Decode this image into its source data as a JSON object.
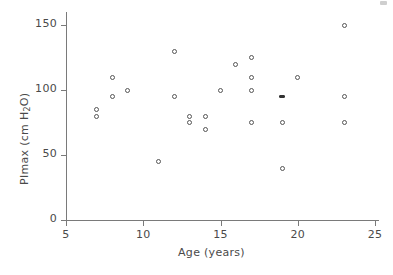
{
  "chart_data": {
    "type": "scatter",
    "title": "",
    "xlabel": "Age (years)",
    "ylabel_plain": "PImax (cm H2O)",
    "ylabel_pre": "PImax (cm H",
    "ylabel_sub": "2",
    "ylabel_post": "O)",
    "xlim": [
      5,
      25
    ],
    "ylim": [
      0,
      160
    ],
    "xticks": [
      5,
      10,
      15,
      20,
      25
    ],
    "xtick_labels": [
      "5",
      "10",
      "15",
      "20",
      "25"
    ],
    "yticks": [
      0,
      50,
      100,
      150
    ],
    "ytick_labels": [
      "0",
      "50",
      "100",
      "150"
    ],
    "grid": false,
    "legend": null,
    "marker": "open-circle",
    "x": [
      7,
      7,
      8,
      8,
      9,
      11,
      12,
      12,
      13,
      13,
      14,
      14,
      15,
      16,
      17,
      17,
      17,
      17,
      19,
      19,
      19,
      20,
      23,
      23,
      23
    ],
    "y": [
      80,
      85,
      110,
      95,
      100,
      45,
      130,
      95,
      75,
      80,
      70,
      80,
      100,
      120,
      125,
      110,
      100,
      75,
      40,
      75,
      95,
      110,
      150,
      95,
      75
    ],
    "points": [
      {
        "x": 7,
        "y": 80,
        "style": "open"
      },
      {
        "x": 7,
        "y": 85,
        "style": "open"
      },
      {
        "x": 8,
        "y": 110,
        "style": "open"
      },
      {
        "x": 8,
        "y": 95,
        "style": "open"
      },
      {
        "x": 9,
        "y": 100,
        "style": "open"
      },
      {
        "x": 11,
        "y": 45,
        "style": "open"
      },
      {
        "x": 12,
        "y": 130,
        "style": "open"
      },
      {
        "x": 12,
        "y": 95,
        "style": "open"
      },
      {
        "x": 13,
        "y": 75,
        "style": "open"
      },
      {
        "x": 13,
        "y": 80,
        "style": "open"
      },
      {
        "x": 14,
        "y": 70,
        "style": "open"
      },
      {
        "x": 14,
        "y": 80,
        "style": "open"
      },
      {
        "x": 15,
        "y": 100,
        "style": "open"
      },
      {
        "x": 16,
        "y": 120,
        "style": "open"
      },
      {
        "x": 17,
        "y": 125,
        "style": "open"
      },
      {
        "x": 17,
        "y": 110,
        "style": "open"
      },
      {
        "x": 17,
        "y": 100,
        "style": "open"
      },
      {
        "x": 17,
        "y": 75,
        "style": "open"
      },
      {
        "x": 19,
        "y": 40,
        "style": "open"
      },
      {
        "x": 19,
        "y": 75,
        "style": "open"
      },
      {
        "x": 19,
        "y": 95,
        "style": "filled"
      },
      {
        "x": 20,
        "y": 110,
        "style": "open"
      },
      {
        "x": 23,
        "y": 150,
        "style": "open"
      },
      {
        "x": 23,
        "y": 95,
        "style": "open"
      },
      {
        "x": 23,
        "y": 75,
        "style": "open"
      }
    ]
  },
  "colors": {
    "background": "#ffffff",
    "axis": "#7a7a7a",
    "text": "#4a4a4a",
    "marker": "#555555"
  }
}
